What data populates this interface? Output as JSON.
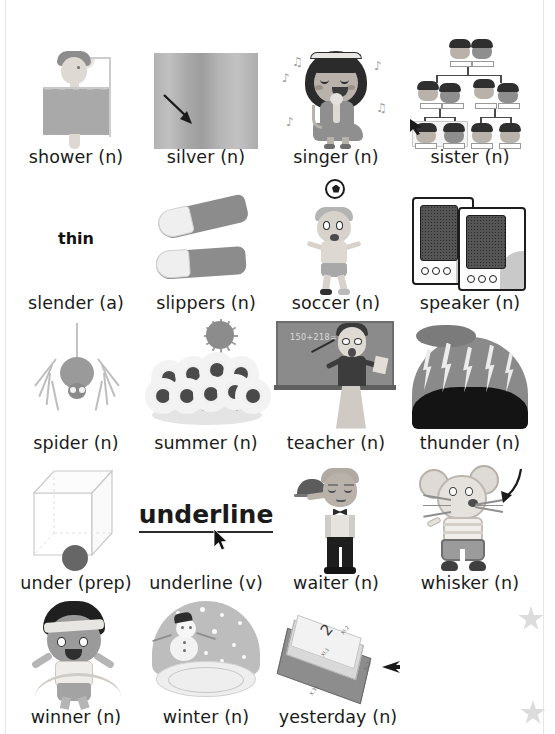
{
  "page": {
    "background_color": "#ffffff",
    "text_color": "#1b1b1b"
  },
  "decorations": {
    "star_icon_name": "star-icon",
    "star_color": "#dcdcdc",
    "star_count": 2
  },
  "entries": [
    {
      "id": "shower",
      "word": "shower",
      "pos": "(n)",
      "label": "shower (n)",
      "art": "shower-illustration"
    },
    {
      "id": "silver",
      "word": "silver",
      "pos": "(n)",
      "label": "silver (n)",
      "art": "silver-swatch"
    },
    {
      "id": "singer",
      "word": "singer",
      "pos": "(n)",
      "label": "singer (n)",
      "art": "singer-illustration"
    },
    {
      "id": "sister",
      "word": "sister",
      "pos": "(n)",
      "label": "sister (n)",
      "art": "family-tree-illustration"
    },
    {
      "id": "slender",
      "word": "slender",
      "pos": "(a)",
      "label": "slender (a)",
      "art": "thin-word-text",
      "art_text": "thin"
    },
    {
      "id": "slippers",
      "word": "slippers",
      "pos": "(n)",
      "label": "slippers (n)",
      "art": "slippers-illustration"
    },
    {
      "id": "soccer",
      "word": "soccer",
      "pos": "(n)",
      "label": "soccer (n)",
      "art": "soccer-boy-illustration"
    },
    {
      "id": "speaker",
      "word": "speaker",
      "pos": "(n)",
      "label": "speaker (n)",
      "art": "computer-speakers-illustration"
    },
    {
      "id": "spider",
      "word": "spider",
      "pos": "(n)",
      "label": "spider (n)",
      "art": "spider-illustration"
    },
    {
      "id": "summer",
      "word": "summer",
      "pos": "(n)",
      "label": "summer (n)",
      "art": "sunflowers-sun-illustration"
    },
    {
      "id": "teacher",
      "word": "teacher",
      "pos": "(n)",
      "label": "teacher (n)",
      "art": "teacher-blackboard-illustration",
      "art_text": "150+218="
    },
    {
      "id": "thunder",
      "word": "thunder",
      "pos": "(n)",
      "label": "thunder (n)",
      "art": "thunderstorm-illustration"
    },
    {
      "id": "under",
      "word": "under",
      "pos": "(prep)",
      "label": "under (prep)",
      "art": "cube-with-ball-under-illustration"
    },
    {
      "id": "underline",
      "word": "underline",
      "pos": "(v)",
      "label": "underline (v)",
      "art": "underlined-word-text",
      "art_text": "underline"
    },
    {
      "id": "waiter",
      "word": "waiter",
      "pos": "(n)",
      "label": "waiter (n)",
      "art": "waiter-illustration"
    },
    {
      "id": "whisker",
      "word": "whisker",
      "pos": "(n)",
      "label": "whisker (n)",
      "art": "mouse-whiskers-illustration"
    },
    {
      "id": "winner",
      "word": "winner",
      "pos": "(n)",
      "label": "winner (n)",
      "art": "winner-boy-ribbon-illustration"
    },
    {
      "id": "winter",
      "word": "winter",
      "pos": "(n)",
      "label": "winter (n)",
      "art": "snow-globe-illustration"
    },
    {
      "id": "yesterday",
      "word": "yesterday",
      "pos": "(n)",
      "label": "yesterday (n)",
      "art": "calendar-pages-illustration",
      "art_text": {
        "big": "2",
        "small_top": "XI.2",
        "small_mid": "XI.1",
        "small_right": "XI.2",
        "small_bottom": "X.31"
      }
    }
  ]
}
